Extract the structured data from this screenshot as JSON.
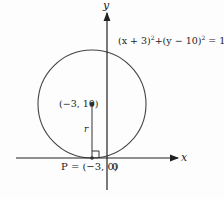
{
  "diagram": {
    "equation": "(x + 3)² + (y − 10)² = 100",
    "equation_parts": {
      "a": "(x + 3)",
      "b": "+(y − 10)",
      "c": " = 100",
      "exp": "2"
    },
    "center_label": "(−3, 10)",
    "radius_label": "r",
    "tangent_point_label": "P = (−3, 0)",
    "origin_label": "0",
    "x_axis_label": "x",
    "y_axis_label": "y",
    "colors": {
      "stroke": "#333333",
      "text": "#222222",
      "background": "#fdfdfd"
    }
  }
}
